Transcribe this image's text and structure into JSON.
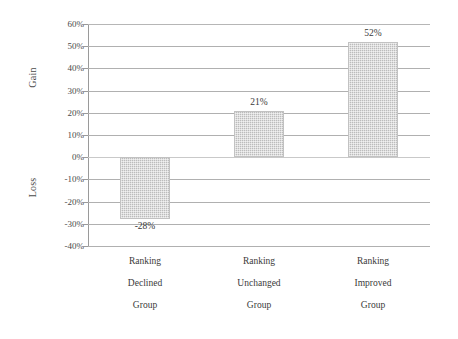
{
  "chart_data": {
    "type": "bar",
    "title": "",
    "subtitle": "",
    "xlabel": "",
    "ylabel": "",
    "categories": [
      "Ranking Declined Group",
      "Ranking Unchanged Group",
      "Ranking Improved Group"
    ],
    "category_lines": [
      [
        "Ranking",
        "Declined",
        "Group"
      ],
      [
        "Ranking",
        "Unchanged",
        "Group"
      ],
      [
        "Ranking",
        "Improved",
        "Group"
      ]
    ],
    "values": [
      -28,
      21,
      52
    ],
    "value_labels": [
      "-28%",
      "21%",
      "52%"
    ],
    "ylim": [
      -40,
      60
    ],
    "ytick_values": [
      60,
      50,
      40,
      30,
      20,
      10,
      0,
      -10,
      -20,
      -30,
      -40
    ],
    "ytick_labels": [
      "60%",
      "50%",
      "40%",
      "30%",
      "20%",
      "10%",
      "0%",
      "-10%",
      "-20%",
      "-30%",
      "-40%"
    ],
    "grid": true,
    "legend": false,
    "legend_position": "none",
    "axis_side_labels": {
      "positive": "Gain",
      "negative": "Loss"
    },
    "colors": {
      "bar_fill": "#bcbcbc",
      "bar_border": "#c2c2c2",
      "gridline": "#b0b0b0",
      "axis": "#9a9a9a",
      "text": "#3a3a3a",
      "background": "#ffffff"
    }
  }
}
